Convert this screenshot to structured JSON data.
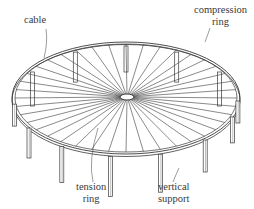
{
  "figure": {
    "line_color": "#3a3a3a",
    "background": "#ffffff"
  },
  "labels": {
    "cable": "cable",
    "compression_ring_line1": "compression",
    "compression_ring_line2": "ring",
    "tension_ring_line1": "tension",
    "tension_ring_line2": "ring",
    "vertical_support_line1": "vertical",
    "vertical_support_line2": "support"
  },
  "geometry": {
    "rim_center": [
      126,
      98
    ],
    "rim_rx": 114,
    "rim_ry": 56,
    "hub_center": [
      127,
      97
    ],
    "hub_rx": 7,
    "hub_ry": 3,
    "cable_count": 40
  }
}
